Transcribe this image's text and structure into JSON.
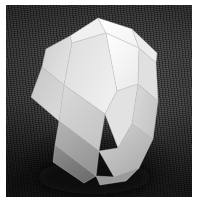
{
  "image": {
    "kind": "photograph",
    "subject_label": "white paper polyhedron model",
    "subject_name": "rhombicuboctahedron-model",
    "background_label": "dark textured cloth backdrop",
    "width_px": 203,
    "height_px": 206,
    "caption": ""
  },
  "palette": {
    "page": "#ffffff",
    "backdrop_light": "#4e4e4e",
    "backdrop_mid": "#3a3a3a",
    "backdrop_dark": "#1b1b1b",
    "highlight_face": "#fbfbfb",
    "bright_face": "#f2f2f2",
    "light_face": "#e6e6e6",
    "mid_face": "#d6d6d6",
    "mid_dark_face": "#c3c3c3",
    "shadow_face": "#a9a9a9",
    "deep_shadow_face": "#8e8e8e",
    "edge_line": "#bdbdbd",
    "cast_shadow": "#141414"
  },
  "photo_frame": {
    "left": 6,
    "top": 5,
    "width": 186,
    "height": 192
  },
  "solid": {
    "name": "rhombicuboctahedron-model",
    "material": "matte white card stock",
    "face_count_visible": 13,
    "faces": [
      {
        "id": "top-left-cap",
        "name": "face-top-left-cap",
        "tone": "#f0f0f0",
        "points": "92,13 64,31 66,38 100,28"
      },
      {
        "id": "top-apex",
        "name": "face-top-apex",
        "tone": "#fbfbfb",
        "points": "92,13 126,24 133,43 100,28"
      },
      {
        "id": "top-right-cap",
        "name": "face-top-right-cap",
        "tone": "#ececec",
        "points": "126,24 151,48 150,58 133,43"
      },
      {
        "id": "upper-left-large",
        "name": "face-upper-left-large",
        "tone": "#dedede",
        "points": "64,31 66,38 58,80 36,62 40,44"
      },
      {
        "id": "left-square",
        "name": "face-left-square",
        "tone": "#d2d2d2",
        "points": "36,62 58,80 53,116 25,92"
      },
      {
        "id": "front-left-big",
        "name": "face-front-left-big",
        "tone": "#e4e4e4",
        "points": "66,38 100,28 111,86 99,109 58,80"
      },
      {
        "id": "front-center-big",
        "name": "face-front-center-big",
        "tone": "#f4f4f4",
        "points": "100,28 133,43 132,79 111,86"
      },
      {
        "id": "front-right-big",
        "name": "face-front-right-big",
        "tone": "#e0e0e0",
        "points": "133,43 150,58 152,96 132,79"
      },
      {
        "id": "right-square",
        "name": "face-right-square",
        "tone": "#d0d0d0",
        "points": "132,79 152,96 147,134 126,119"
      },
      {
        "id": "front-mid-left",
        "name": "face-front-mid-left",
        "tone": "#cfcfcf",
        "points": "58,80 99,109 93,146 53,116"
      },
      {
        "id": "front-mid-center",
        "name": "face-front-mid-center",
        "tone": "#e2e2e2",
        "points": "99,109 111,86 132,79 126,119 112,143"
      },
      {
        "id": "lower-left-shadow",
        "name": "face-lower-left-shadow",
        "tone": "#a6a6a6",
        "points": "53,116 93,146 90,171 49,140"
      },
      {
        "id": "bottom-left-shadow",
        "name": "face-bottom-left-shadow",
        "tone": "#8d8d8d",
        "points": "49,140 90,171 78,178 47,157"
      },
      {
        "id": "lower-right-shadow",
        "name": "face-lower-right-shadow",
        "tone": "#bdbdbd",
        "points": "93,146 112,143 126,119 147,134 133,163 108,172"
      },
      {
        "id": "bottom-front-shadow",
        "name": "face-bottom-front-shadow",
        "tone": "#9a9a9a",
        "points": "90,171 108,172 133,163 120,176 94,180"
      }
    ],
    "silhouette": "92,13 126,24 151,48 152,96 147,134 133,163 120,176 94,180 78,178 47,157 25,92 36,62 40,44 64,31",
    "highlight_note": "strong highlight on upper-right top facets",
    "shadow_note": "deep shading on lower-left and bottom facets"
  }
}
